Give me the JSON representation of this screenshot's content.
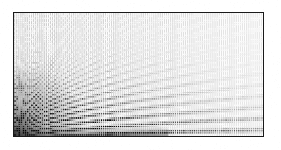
{
  "figure": {
    "title": "",
    "background_color": "#ffffff",
    "frame_color": "#1a1a1a",
    "frame": {
      "x": 13,
      "y": 12,
      "width": 251,
      "height": 125
    },
    "has_axis_labels": false,
    "has_tick_labels": false,
    "has_legend": false,
    "has_gridlines": false
  },
  "chart_data": {
    "type": "heatmap",
    "title": "",
    "subtitle": "",
    "xlabel": "",
    "ylabel": "",
    "xlim": [
      0,
      1
    ],
    "ylim": [
      0,
      1
    ],
    "grid": false,
    "legend": false,
    "legend_position": "none",
    "colormap": "grayscale",
    "colormap_min_color": "#ffffff",
    "colormap_max_color": "#000000",
    "marker": "square-dot",
    "grid_columns": 118,
    "grid_rows": 58,
    "dot_pitch_x": 2.12,
    "dot_pitch_y": 2.12,
    "dot_size": 1.45,
    "intensity_model": "cos^2 fringe of phase k*sqrt(x) vs y, attenuated by radial falloff from lower-left origin",
    "fringe_count": 11,
    "fringe_origin": [
      0,
      0
    ],
    "vertical_stripe_period_px": 2.12,
    "vertical_stripe_max_gray": "#d9d9d9",
    "max_density_region": "lower-left",
    "min_density_region": "upper-right",
    "annotations": [],
    "fringe_arcs": [
      {
        "index": 1,
        "label": "fringe-1",
        "peak_gray": "#111111",
        "x_at_bottom": 0.035,
        "y_at_right": 0.1
      },
      {
        "index": 2,
        "label": "fringe-2",
        "peak_gray": "#1c1c1c",
        "x_at_bottom": 0.075,
        "y_at_right": 0.22
      },
      {
        "index": 3,
        "label": "fringe-3",
        "peak_gray": "#292929",
        "x_at_bottom": 0.125,
        "y_at_right": 0.35
      },
      {
        "index": 4,
        "label": "fringe-4",
        "peak_gray": "#343434",
        "x_at_bottom": 0.185,
        "y_at_right": 0.47
      },
      {
        "index": 5,
        "label": "fringe-5",
        "peak_gray": "#444444",
        "x_at_bottom": 0.255,
        "y_at_right": 0.58
      },
      {
        "index": 6,
        "label": "fringe-6",
        "peak_gray": "#555555",
        "x_at_bottom": 0.335,
        "y_at_right": 0.68
      },
      {
        "index": 7,
        "label": "fringe-7",
        "peak_gray": "#6a6a6a",
        "x_at_bottom": 0.425,
        "y_at_right": 0.77
      },
      {
        "index": 8,
        "label": "fringe-8",
        "peak_gray": "#838383",
        "x_at_bottom": 0.525,
        "y_at_right": 0.85
      },
      {
        "index": 9,
        "label": "fringe-9",
        "peak_gray": "#9c9c9c",
        "x_at_bottom": 0.635,
        "y_at_right": 0.92
      },
      {
        "index": 10,
        "label": "fringe-10",
        "peak_gray": "#b5b5b5",
        "x_at_bottom": 0.755,
        "y_at_right": 0.97
      },
      {
        "index": 11,
        "label": "fringe-11",
        "peak_gray": "#cccccc",
        "x_at_bottom": 0.885,
        "y_at_right": 1.0
      }
    ]
  }
}
